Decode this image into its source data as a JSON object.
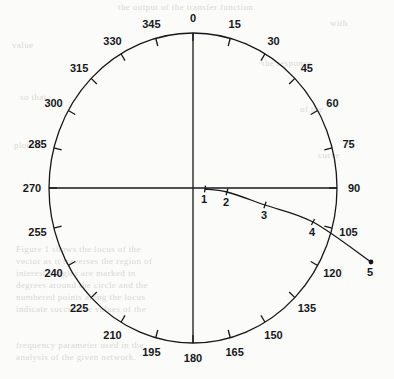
{
  "figure": {
    "background_color": "#fbfbfa",
    "ink_color": "#17171a",
    "bleed_color": "#d9d9d6"
  },
  "chart_data": {
    "type": "line",
    "plot_style": "polar-compass",
    "title": "",
    "subtitle": "",
    "xlabel": "",
    "ylabel": "",
    "grid": false,
    "legend": null,
    "angular_axis": {
      "units": "degrees",
      "direction": "clockwise",
      "zero_at": "top",
      "tick_interval": 15,
      "range": [
        0,
        360
      ],
      "tick_labels": [
        "0",
        "15",
        "30",
        "45",
        "60",
        "75",
        "90",
        "105",
        "120",
        "135",
        "150",
        "165",
        "180",
        "195",
        "210",
        "225",
        "240",
        "255",
        "270",
        "285",
        "300",
        "315",
        "330",
        "345"
      ],
      "tick_values": [
        0,
        15,
        30,
        45,
        60,
        75,
        90,
        105,
        120,
        135,
        150,
        165,
        180,
        195,
        210,
        225,
        240,
        255,
        270,
        285,
        300,
        315,
        330,
        345
      ],
      "cardinal_axes_drawn": [
        "0-180",
        "270-90"
      ]
    },
    "series": [
      {
        "name": "curve",
        "marker": "tick",
        "endpoint_marker": "dot",
        "point_labels": [
          "1",
          "2",
          "3",
          "4",
          "5"
        ],
        "points": [
          {
            "label": "1",
            "x": 205,
            "y": 189
          },
          {
            "label": "2",
            "x": 227,
            "y": 192
          },
          {
            "label": "3",
            "x": 265,
            "y": 205
          },
          {
            "label": "4",
            "x": 313,
            "y": 222
          },
          {
            "label": "5",
            "x": 371,
            "y": 262
          }
        ]
      }
    ]
  },
  "geometry": {
    "center": {
      "x": 193,
      "y": 188
    },
    "radius_x": 144,
    "radius_y": 155,
    "tick_length": 8
  },
  "bleed_text": {
    "lines": [
      {
        "text": "the output of the transfer function",
        "x": 118,
        "y": 2
      },
      {
        "text": "with",
        "x": 330,
        "y": 18
      },
      {
        "text": "value",
        "x": 12,
        "y": 40
      },
      {
        "text": "the response",
        "x": 262,
        "y": 58
      },
      {
        "text": "so that",
        "x": 20,
        "y": 92
      },
      {
        "text": "of the",
        "x": 300,
        "y": 104
      },
      {
        "text": "plotted",
        "x": 14,
        "y": 140
      },
      {
        "text": "curve",
        "x": 318,
        "y": 150
      },
      {
        "text": "Figure 1 shows the locus of the",
        "x": 16,
        "y": 244
      },
      {
        "text": "vector as it traverses the region of",
        "x": 16,
        "y": 256
      },
      {
        "text": "interest. Angles are marked in",
        "x": 16,
        "y": 268
      },
      {
        "text": "degrees around the circle and the",
        "x": 16,
        "y": 280
      },
      {
        "text": "numbered points along the locus",
        "x": 16,
        "y": 292
      },
      {
        "text": "indicate successive values of the",
        "x": 16,
        "y": 304
      },
      {
        "text": "frequency parameter used in the",
        "x": 16,
        "y": 340
      },
      {
        "text": "analysis of the given network.",
        "x": 16,
        "y": 352
      }
    ]
  }
}
